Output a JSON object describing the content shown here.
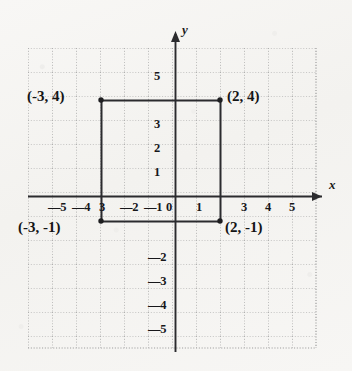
{
  "figure": {
    "background_color": "#f6f5f3",
    "ink_color": "#2b2b2e",
    "grid_color": "#9a9a9a"
  },
  "axes": {
    "x_label": "x",
    "y_label": "y",
    "origin_label": "0"
  },
  "chart_data": {
    "type": "scatter",
    "title": "",
    "xlabel": "x",
    "ylabel": "y",
    "grid": true,
    "legend_position": "none",
    "xlim": [
      -6,
      6
    ],
    "ylim": [
      -6,
      6
    ],
    "x_ticks": [
      -5,
      -4,
      -3,
      -2,
      -1,
      0,
      1,
      3,
      4,
      5
    ],
    "x_tick_labels": [
      "—5",
      "—4",
      "3",
      "—2",
      "—1",
      "0",
      "1",
      "3",
      "4",
      "5"
    ],
    "y_ticks": [
      5,
      3,
      2,
      1,
      -2,
      -3,
      -4,
      -5
    ],
    "y_tick_labels": [
      "5",
      "3",
      "2",
      "1",
      "—2",
      "—3",
      "—4",
      "—5"
    ],
    "points": [
      {
        "name": "top-left",
        "x": -3,
        "y": 4,
        "label": "(-3, 4)"
      },
      {
        "name": "top-right",
        "x": 2,
        "y": 4,
        "label": "(2, 4)"
      },
      {
        "name": "bottom-left",
        "x": -3,
        "y": -1,
        "label": "(-3, -1)"
      },
      {
        "name": "bottom-right",
        "x": 2,
        "y": -1,
        "label": "(2, -1)"
      }
    ],
    "shape": {
      "type": "rectangle",
      "vertices": [
        [
          -3,
          4
        ],
        [
          2,
          4
        ],
        [
          2,
          -1
        ],
        [
          -3,
          -1
        ]
      ],
      "width": 5,
      "height": 5
    }
  },
  "labels": {
    "top_left": "(-3, 4)",
    "top_right": "(2, 4)",
    "bottom_left": "(-3, -1)",
    "bottom_right": "(2, -1)"
  },
  "x_axis_ticks": [
    {
      "text": "—5",
      "left": 48,
      "top": 200
    },
    {
      "text": "—4",
      "left": 72,
      "top": 200
    },
    {
      "text": "3",
      "left": 99,
      "top": 200
    },
    {
      "text": "—2",
      "left": 120,
      "top": 200
    },
    {
      "text": "—1",
      "left": 144,
      "top": 200
    },
    {
      "text": "0",
      "left": 166,
      "top": 200
    },
    {
      "text": "1",
      "left": 196,
      "top": 200
    },
    {
      "text": "3",
      "left": 241,
      "top": 200
    },
    {
      "text": "4",
      "left": 265,
      "top": 200
    },
    {
      "text": "5",
      "left": 289,
      "top": 200
    }
  ],
  "y_axis_ticks": [
    {
      "text": "5",
      "left": 154,
      "top": 69
    },
    {
      "text": "3",
      "left": 154,
      "top": 117
    },
    {
      "text": "2",
      "left": 154,
      "top": 141
    },
    {
      "text": "1",
      "left": 154,
      "top": 165
    },
    {
      "text": "—2",
      "left": 148,
      "top": 250
    },
    {
      "text": "—3",
      "left": 148,
      "top": 274
    },
    {
      "text": "—4",
      "left": 148,
      "top": 298
    },
    {
      "text": "—5",
      "left": 148,
      "top": 322
    }
  ]
}
